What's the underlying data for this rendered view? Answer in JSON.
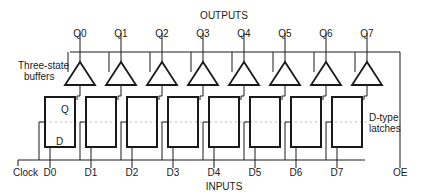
{
  "title": "OUTPUTS",
  "bottom_title": "INPUTS",
  "labels": {
    "buffers_line1": "Three-state",
    "buffers_line2": "buffers",
    "latches_line1": "D-type",
    "latches_line2": "latches",
    "clock": "Clock",
    "oe": "OE",
    "latch_q": "Q",
    "latch_d": "D"
  },
  "outputs": [
    "Q0",
    "Q1",
    "Q2",
    "Q3",
    "Q4",
    "Q5",
    "Q6",
    "Q7"
  ],
  "inputs": [
    "D0",
    "D1",
    "D2",
    "D3",
    "D4",
    "D5",
    "D6",
    "D7"
  ],
  "colors": {
    "line": "#1a1a1a",
    "dash": "#bbbbbb"
  }
}
